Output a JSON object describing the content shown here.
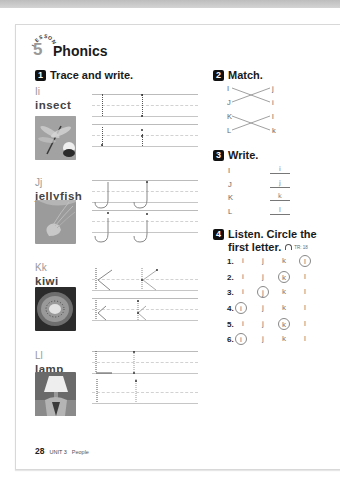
{
  "page": {
    "lesson_label": "LESSON",
    "lesson_number": "5",
    "title": "Phonics",
    "footer": {
      "page_number": "28",
      "unit": "UNIT 3",
      "topic": "People"
    }
  },
  "section1": {
    "number": "1",
    "instruction": "Trace and write.",
    "items": [
      {
        "letters": "Ii",
        "word": "insect",
        "photo": "dragonfly-photo"
      },
      {
        "letters": "Jj",
        "word": "jellyfish",
        "photo": "jellyfish-photo"
      },
      {
        "letters": "Kk",
        "word": "kiwi",
        "photo": "kiwi-photo"
      },
      {
        "letters": "Ll",
        "word": "lamp",
        "photo": "lamp-photo"
      }
    ]
  },
  "section2": {
    "number": "2",
    "instruction": "Match.",
    "left": [
      "I",
      "J",
      "K",
      "L"
    ],
    "right": [
      "j",
      "i",
      "l",
      "k"
    ]
  },
  "section3": {
    "number": "3",
    "instruction": "Write.",
    "rows": [
      {
        "upper": "I",
        "answer": "i"
      },
      {
        "upper": "J",
        "answer": "j"
      },
      {
        "upper": "K",
        "answer": "k"
      },
      {
        "upper": "L",
        "answer": "l"
      }
    ]
  },
  "section4": {
    "number": "4",
    "instruction_line1": "Listen. Circle the",
    "instruction_line2": "first letter.",
    "track": "TR: 18",
    "options": [
      "i",
      "j",
      "k",
      "l"
    ],
    "questions": [
      {
        "num": "1.",
        "circled": 3
      },
      {
        "num": "2.",
        "circled": 2
      },
      {
        "num": "3.",
        "circled": 1
      },
      {
        "num": "4.",
        "circled": 0
      },
      {
        "num": "5.",
        "circled": 2
      },
      {
        "num": "6.",
        "circled": 0
      }
    ]
  }
}
